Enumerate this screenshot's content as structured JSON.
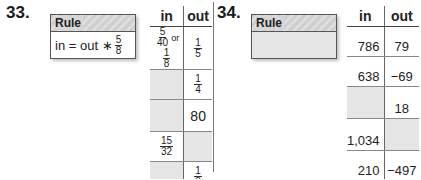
{
  "problems": [
    {
      "number": "33.",
      "rule_label": "Rule",
      "rule_text_prefix": "in = out ∗",
      "rule_fraction": {
        "n": "5",
        "d": "8"
      },
      "headers": {
        "in": "in",
        "out": "out"
      },
      "rows": [
        {
          "in": {
            "type": "fraction_or",
            "a": {
              "n": "5",
              "d": "40"
            },
            "or": "or",
            "b": {
              "n": "1",
              "d": "8"
            }
          },
          "out": {
            "type": "fraction",
            "n": "1",
            "d": "5"
          }
        },
        {
          "in": {
            "type": "blank"
          },
          "out": {
            "type": "fraction",
            "n": "1",
            "d": "4"
          }
        },
        {
          "in": {
            "type": "blank"
          },
          "out": {
            "type": "text",
            "value": "80"
          }
        },
        {
          "in": {
            "type": "fraction",
            "n": "15",
            "d": "32"
          },
          "out": {
            "type": "blank"
          }
        },
        {
          "in": {
            "type": "blank"
          },
          "out": {
            "type": "fraction",
            "n": "1",
            "d": "3"
          }
        }
      ]
    },
    {
      "number": "34.",
      "rule_label": "Rule",
      "rule_text": "",
      "headers": {
        "in": "in",
        "out": "out"
      },
      "rows": [
        {
          "in": "786",
          "out": "79"
        },
        {
          "in": "638",
          "out": "−69"
        },
        {
          "in": "",
          "out": "18"
        },
        {
          "in": "1,034",
          "out": ""
        },
        {
          "in": "210",
          "out": "−497"
        }
      ]
    }
  ]
}
